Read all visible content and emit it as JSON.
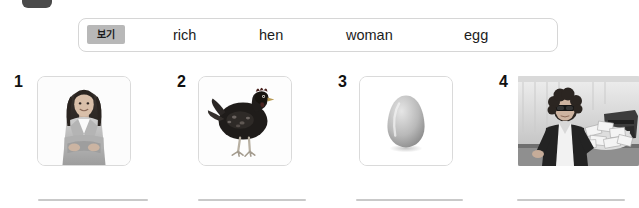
{
  "corner": {
    "name": "tab-fragment",
    "color": "#4a4a4a"
  },
  "word_bank": {
    "label": "보기",
    "label_bg": "#b8b8b8",
    "border_color": "#d6d6d6",
    "words": [
      "rich",
      "hen",
      "woman",
      "egg"
    ]
  },
  "items": [
    {
      "number": "1",
      "image": "woman-photo",
      "alt": "smiling woman with arms crossed"
    },
    {
      "number": "2",
      "image": "hen-photo",
      "alt": "black hen standing"
    },
    {
      "number": "3",
      "image": "egg-photo",
      "alt": "white egg"
    },
    {
      "number": "4",
      "image": "rich-photo",
      "alt": "person in sunglasses with typewriter and cash"
    }
  ],
  "answer_lines": [
    "",
    "",
    "",
    ""
  ]
}
